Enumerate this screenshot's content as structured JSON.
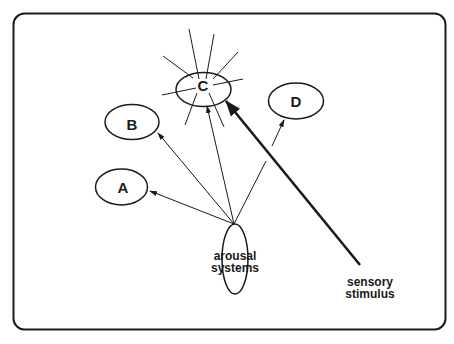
{
  "diagram": {
    "nodes": [
      {
        "id": "A",
        "label": "A"
      },
      {
        "id": "B",
        "label": "B"
      },
      {
        "id": "C",
        "label": "C",
        "state": "activated"
      },
      {
        "id": "D",
        "label": "D"
      }
    ],
    "source": {
      "label_line1": "arousal",
      "label_line2": "systems"
    },
    "stimulus": {
      "label_line1": "sensory",
      "label_line2": "stimulus"
    },
    "edges": [
      {
        "from": "arousal systems",
        "to": "A",
        "style": "thin"
      },
      {
        "from": "arousal systems",
        "to": "B",
        "style": "thin"
      },
      {
        "from": "arousal systems",
        "to": "C",
        "style": "thin"
      },
      {
        "from": "arousal systems",
        "to": "D",
        "style": "thin"
      },
      {
        "from": "sensory stimulus",
        "to": "C",
        "style": "thick"
      }
    ],
    "colors": {
      "stroke": "#1a1a1a",
      "background": "#ffffff"
    }
  }
}
